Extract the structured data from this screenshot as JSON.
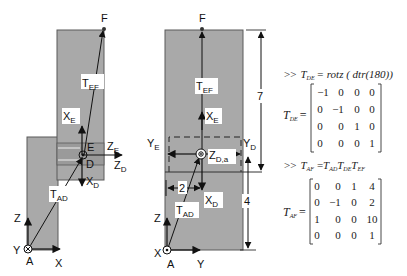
{
  "colors": {
    "body_fill": "#a9a9a9",
    "body_stroke": "#5a5a5a",
    "band_fill": "#8f8f8f",
    "line": "#111111",
    "text": "#111111",
    "label_bg": "#ffffff"
  },
  "left_figure": {
    "points": {
      "F": "F",
      "E": "E",
      "D": "D",
      "A": "A"
    },
    "labels": {
      "T_EF": {
        "main": "T",
        "sub": "EF"
      },
      "X_E": {
        "main": "X",
        "sub": "E"
      },
      "Z_E": {
        "main": "Z",
        "sub": "E"
      },
      "Z_D": {
        "main": "Z",
        "sub": "D"
      },
      "X_D": {
        "main": "X",
        "sub": "D"
      },
      "T_AD": {
        "main": "T",
        "sub": "AD"
      },
      "Z": "Z",
      "Y": "Y",
      "X": "X"
    }
  },
  "right_figure": {
    "points": {
      "F": "F",
      "A": "A"
    },
    "labels": {
      "T_EF": {
        "main": "T",
        "sub": "EF"
      },
      "X_E": {
        "main": "X",
        "sub": "E"
      },
      "Y_E": {
        "main": "Y",
        "sub": "E"
      },
      "Y_D": {
        "main": "Y",
        "sub": "D"
      },
      "Z_Da": {
        "main": "Z",
        "sub": "D,a"
      },
      "X_D": {
        "main": "X",
        "sub": "D"
      },
      "T_AD": {
        "main": "T",
        "sub": "AD"
      },
      "Z": "Z",
      "X": "X",
      "Y": "Y"
    },
    "dimensions": {
      "upper": "7",
      "lower": "4",
      "offset": "2"
    }
  },
  "equations": {
    "eq1": {
      "prompt": ">>",
      "lhs_main": "T",
      "lhs_sub": "DE",
      "rhs": "= rotz ( dtr(180))",
      "matrix_name_main": "T",
      "matrix_name_sub": "DE",
      "matrix": [
        [
          "−1",
          "0",
          "0",
          "0"
        ],
        [
          "0",
          "−1",
          "0",
          "0"
        ],
        [
          "0",
          "0",
          "1",
          "0"
        ],
        [
          "0",
          "0",
          "0",
          "1"
        ]
      ]
    },
    "eq2": {
      "prompt": ">>",
      "lhs_main": "T",
      "lhs_sub": "AF",
      "rhs_terms": [
        {
          "main": "T",
          "sub": "AD"
        },
        {
          "main": "T",
          "sub": "DE"
        },
        {
          "main": "T",
          "sub": "EF"
        }
      ],
      "matrix_name_main": "T",
      "matrix_name_sub": "AF",
      "matrix": [
        [
          "0",
          "0",
          "1",
          "4"
        ],
        [
          "0",
          "−1",
          "0",
          "2"
        ],
        [
          "1",
          "0",
          "0",
          "10"
        ],
        [
          "0",
          "0",
          "0",
          "1"
        ]
      ]
    }
  }
}
